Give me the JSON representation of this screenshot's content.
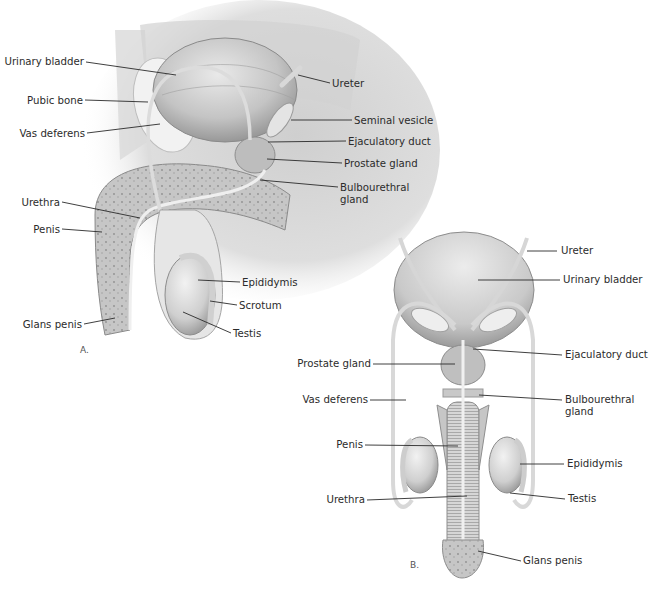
{
  "figure": {
    "panels": [
      {
        "id": "A",
        "label": "A.",
        "view": "sagittal section",
        "callouts": [
          {
            "key": "urinary_bladder",
            "text": "Urinary bladder",
            "side": "left"
          },
          {
            "key": "pubic_bone",
            "text": "Pubic bone",
            "side": "left"
          },
          {
            "key": "vas_deferens",
            "text": "Vas deferens",
            "side": "left"
          },
          {
            "key": "urethra",
            "text": "Urethra",
            "side": "left"
          },
          {
            "key": "penis",
            "text": "Penis",
            "side": "left"
          },
          {
            "key": "glans_penis",
            "text": "Glans penis",
            "side": "left"
          },
          {
            "key": "ureter",
            "text": "Ureter",
            "side": "right"
          },
          {
            "key": "seminal_vesicle",
            "text": "Seminal vesicle",
            "side": "right"
          },
          {
            "key": "ejaculatory_duct",
            "text": "Ejaculatory duct",
            "side": "right"
          },
          {
            "key": "prostate_gland",
            "text": "Prostate gland",
            "side": "right"
          },
          {
            "key": "bulbourethral_gland",
            "text": [
              "Bulbourethral",
              "gland"
            ],
            "side": "right"
          },
          {
            "key": "epididymis",
            "text": "Epididymis",
            "side": "right"
          },
          {
            "key": "scrotum",
            "text": "Scrotum",
            "side": "right"
          },
          {
            "key": "testis",
            "text": "Testis",
            "side": "right"
          }
        ]
      },
      {
        "id": "B",
        "label": "B.",
        "view": "frontal view",
        "callouts": [
          {
            "key": "ureter",
            "text": "Ureter",
            "side": "right"
          },
          {
            "key": "urinary_bladder",
            "text": "Urinary bladder",
            "side": "right"
          },
          {
            "key": "ejaculatory_duct",
            "text": "Ejaculatory duct",
            "side": "right"
          },
          {
            "key": "bulbourethral_gland",
            "text": [
              "Bulbourethral",
              "gland"
            ],
            "side": "right"
          },
          {
            "key": "epididymis",
            "text": "Epididymis",
            "side": "right"
          },
          {
            "key": "testis",
            "text": "Testis",
            "side": "right"
          },
          {
            "key": "glans_penis",
            "text": "Glans penis",
            "side": "right"
          },
          {
            "key": "prostate_gland",
            "text": "Prostate gland",
            "side": "left"
          },
          {
            "key": "vas_deferens",
            "text": "Vas deferens",
            "side": "left"
          },
          {
            "key": "penis",
            "text": "Penis",
            "side": "left"
          },
          {
            "key": "urethra",
            "text": "Urethra",
            "side": "left"
          }
        ]
      }
    ]
  },
  "colors": {
    "background": "#ffffff",
    "tissue_light": "#e4e4e4",
    "tissue_mid": "#c9c9c9",
    "tissue_dark": "#9d9d9d",
    "label_text": "#2b2b2b",
    "leader_line": "#2a2a2a"
  }
}
